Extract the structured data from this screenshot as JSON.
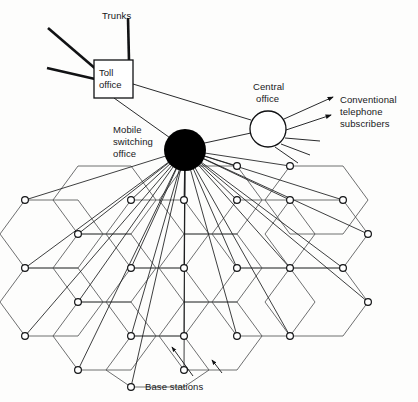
{
  "diagram": {
    "labels": {
      "trunks": "Trunks",
      "toll_office_line1": "Toll",
      "toll_office_line2": "office",
      "central_office_line1": "Central",
      "central_office_line2": "office",
      "mobile_switching_line1": "Mobile",
      "mobile_switching_line2": "switching",
      "mobile_switching_line3": "office",
      "subscribers_line1": "Conventional",
      "subscribers_line2": "telephone",
      "subscribers_line3": "subscribers",
      "base_stations": "Base stations"
    },
    "colors": {
      "ink": "#111214",
      "hex_stroke": "#4a4b4d",
      "node_fill": "#ffffff",
      "mso_fill": "#000000",
      "background": "#fdfdfc"
    },
    "nodes": {
      "toll_office": {
        "x": 113,
        "y": 79,
        "w": 40,
        "h": 39,
        "shape": "rect"
      },
      "central_office": {
        "x": 268,
        "y": 129,
        "r": 18,
        "shape": "circle"
      },
      "mobile_switching_office": {
        "x": 185,
        "y": 150,
        "r": 21,
        "shape": "filled-circle"
      }
    },
    "trunk_lines": [
      {
        "x1": 48,
        "y1": 28,
        "x2": 96,
        "y2": 69
      },
      {
        "x1": 128,
        "y1": 18,
        "x2": 129,
        "y2": 60
      },
      {
        "x1": 47,
        "y1": 68,
        "x2": 94,
        "y2": 78
      }
    ],
    "connections": [
      {
        "from": "toll_office",
        "to": "central_office"
      },
      {
        "from": "toll_office",
        "to": "mobile_switching_office"
      },
      {
        "from": "mobile_switching_office",
        "to": "central_office"
      }
    ],
    "subscriber_rays": [
      {
        "x1": 285,
        "y1": 118,
        "x2": 334,
        "y2": 97,
        "arrow": true
      },
      {
        "x1": 287,
        "y1": 131,
        "x2": 332,
        "y2": 114,
        "arrow": true
      },
      {
        "x1": 285,
        "y1": 139,
        "x2": 321,
        "y2": 141,
        "arrow": false
      },
      {
        "x1": 281,
        "y1": 145,
        "x2": 311,
        "y2": 155,
        "arrow": false
      },
      {
        "x1": 275,
        "y1": 147,
        "x2": 299,
        "y2": 163,
        "arrow": false
      }
    ],
    "base_station_arrows": [
      {
        "x1": 193,
        "y1": 376,
        "x2": 170,
        "y2": 345
      },
      {
        "x1": 222,
        "y1": 373,
        "x2": 210,
        "y2": 359
      }
    ],
    "counts": {
      "base_stations": 26,
      "spokes": 26,
      "hex_cells": 13
    }
  }
}
